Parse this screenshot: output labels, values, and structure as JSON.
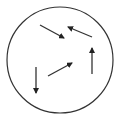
{
  "diagram": {
    "background": "#ffffff",
    "stroke_color": "#333333",
    "circle": {
      "cx": 60,
      "cy": 60,
      "r": 53,
      "stroke_width": 1.2
    },
    "arrows": [
      {
        "id": "arrow-down-right",
        "direction": "down-right",
        "x1": 40,
        "y1": 25,
        "x2": 64,
        "y2": 38
      },
      {
        "id": "arrow-up-left",
        "direction": "up-left",
        "x1": 92,
        "y1": 37,
        "x2": 68,
        "y2": 27
      },
      {
        "id": "arrow-up",
        "direction": "up",
        "x1": 92,
        "y1": 74,
        "x2": 92,
        "y2": 48
      },
      {
        "id": "arrow-down",
        "direction": "down",
        "x1": 36,
        "y1": 67,
        "x2": 36,
        "y2": 93
      },
      {
        "id": "arrow-up-right",
        "direction": "up-right",
        "x1": 48,
        "y1": 76,
        "x2": 72,
        "y2": 63
      }
    ]
  }
}
